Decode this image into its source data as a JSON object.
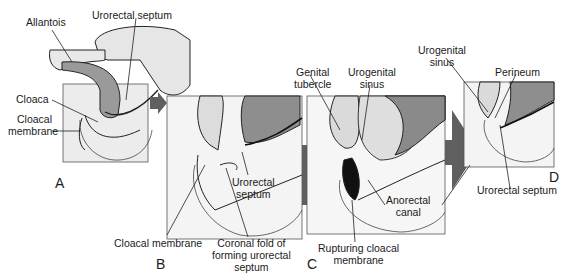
{
  "figure": {
    "panels": [
      {
        "id": "A",
        "label": "A"
      },
      {
        "id": "B",
        "label": "B"
      },
      {
        "id": "C",
        "label": "C"
      },
      {
        "id": "D",
        "label": "D"
      }
    ],
    "labels": {
      "allantois": "Allantois",
      "urorectal_septum_a": "Urorectal septum",
      "cloaca": "Cloaca",
      "cloacal_membrane_a_1": "Cloacal",
      "cloacal_membrane_a_2": "membrane",
      "urorectal_septum_b_1": "Urorectal",
      "urorectal_septum_b_2": "septum",
      "cloacal_membrane_b": "Cloacal membrane",
      "coronal_fold_1": "Coronal fold of",
      "coronal_fold_2": "forming urorectal",
      "coronal_fold_3": "septum",
      "genital_tubercle_1": "Genital",
      "genital_tubercle_2": "tubercle",
      "urogenital_sinus_c_1": "Urogenital",
      "urogenital_sinus_c_2": "sinus",
      "anorectal_canal_1": "Anorectal",
      "anorectal_canal_2": "canal",
      "rupturing_1": "Rupturing cloacal",
      "rupturing_2": "membrane",
      "urogenital_sinus_d_1": "Urogenital",
      "urogenital_sinus_d_2": "sinus",
      "perineum": "Perineum",
      "urorectal_septum_d": "Urorectal septum"
    },
    "colors": {
      "dark_gray": "#7a7a7a",
      "mid_gray": "#b8b8b8",
      "light_gray": "#dedede",
      "arrow": "#5f5f5f",
      "line": "#222222"
    }
  }
}
